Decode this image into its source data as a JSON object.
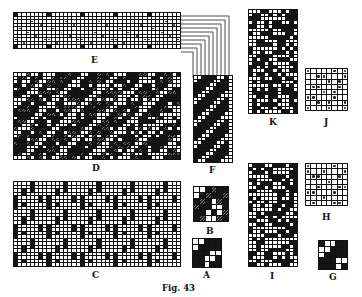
{
  "figure": {
    "caption": "Fig. 43",
    "labels": {
      "A": "A",
      "B": "B",
      "C": "C",
      "D": "D",
      "E": "E",
      "F": "F",
      "G": "G",
      "H": "H",
      "I": "I",
      "J": "J",
      "K": "K"
    }
  },
  "panels": [
    {
      "id": "E",
      "kind": "draft grid with x marks",
      "cols": 40,
      "rows": 10
    },
    {
      "id": "D",
      "kind": "twill weave pattern",
      "cols": 40,
      "rows": 24
    },
    {
      "id": "F",
      "kind": "diagonal twill strip",
      "cols": 10,
      "rows": 24
    },
    {
      "id": "C",
      "kind": "block weave pattern",
      "cols": 40,
      "rows": 24
    },
    {
      "id": "B",
      "kind": "shaded point paper",
      "cols": 6,
      "rows": 6
    },
    {
      "id": "A",
      "kind": "solid point paper",
      "cols": 5,
      "rows": 5
    },
    {
      "id": "K",
      "kind": "weave pattern",
      "cols": 12,
      "rows": 28
    },
    {
      "id": "J",
      "kind": "dotted point paper",
      "cols": 8,
      "rows": 8
    },
    {
      "id": "I",
      "kind": "weave pattern",
      "cols": 12,
      "rows": 28
    },
    {
      "id": "H",
      "kind": "dotted point paper",
      "cols": 8,
      "rows": 8
    },
    {
      "id": "G",
      "kind": "solid point paper",
      "cols": 5,
      "rows": 5
    }
  ],
  "colors": {
    "ink": "#151515",
    "paper": "#ffffff"
  }
}
